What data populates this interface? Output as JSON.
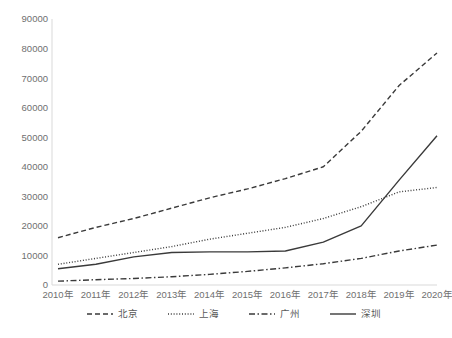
{
  "chart_data": {
    "type": "line",
    "title": "",
    "subtitle": "",
    "xlabel": "",
    "ylabel": "",
    "categories": [
      "2010年",
      "2011年",
      "2012年",
      "2013年",
      "2014年",
      "2015年",
      "2016年",
      "2017年",
      "2018年",
      "2019年",
      "2020年"
    ],
    "ylim": [
      0,
      90000
    ],
    "ytick_labels": [
      "90000",
      "80000",
      "70000",
      "60000",
      "50000",
      "40000",
      "30000",
      "20000",
      "10000",
      "0"
    ],
    "ytick_values": [
      90000,
      80000,
      70000,
      60000,
      50000,
      40000,
      30000,
      20000,
      10000,
      0
    ],
    "grid": false,
    "legend_position": "bottom",
    "series": [
      {
        "name": "北京",
        "dash": "dashed",
        "dasharray": "5,3",
        "values": [
          16000,
          19500,
          22500,
          26000,
          29500,
          32500,
          36000,
          40000,
          52000,
          67500,
          78500
        ]
      },
      {
        "name": "上海",
        "dash": "dotted",
        "dasharray": "1,1.8",
        "values": [
          7000,
          9000,
          11000,
          13000,
          15500,
          17500,
          19500,
          22500,
          26500,
          31500,
          33000
        ]
      },
      {
        "name": "广州",
        "dash": "dashdot",
        "dasharray": "6,2.5,1.5,2.5",
        "values": [
          1300,
          1800,
          2200,
          2800,
          3600,
          4600,
          5800,
          7200,
          9000,
          11500,
          13500
        ]
      },
      {
        "name": "深圳",
        "dash": "solid",
        "dasharray": "none",
        "values": [
          5500,
          7000,
          9500,
          11000,
          11200,
          11200,
          11500,
          14500,
          20000,
          35500,
          50500
        ]
      }
    ]
  },
  "legend": {
    "items": [
      {
        "label": "北京",
        "dasharray": "5,3"
      },
      {
        "label": "上海",
        "dasharray": "1,1.8"
      },
      {
        "label": "广州",
        "dasharray": "6,2.5,1.5,2.5"
      },
      {
        "label": "深圳",
        "dasharray": "none"
      }
    ]
  },
  "colors": {
    "line": "#3a3a3a",
    "tick_text": "#6f6f6f",
    "legend_text": "#595959",
    "axis": "#d9d9d9",
    "background": "#ffffff"
  }
}
